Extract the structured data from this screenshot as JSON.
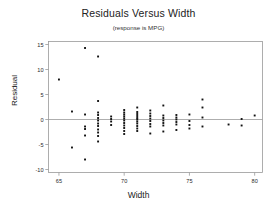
{
  "chart_data": {
    "type": "scatter",
    "title": "Residuals Versus Width",
    "subtitle": "(response is MPG)",
    "xlabel": "Width",
    "ylabel": "Residual",
    "xlim": [
      64.2,
      80.6
    ],
    "ylim": [
      -10.6,
      15.6
    ],
    "xticks": [
      65,
      70,
      75,
      80
    ],
    "xtick_labels": [
      "65",
      "70",
      "75",
      "80"
    ],
    "yticks": [
      15,
      10,
      5,
      0,
      -5,
      -10
    ],
    "ytick_labels": [
      "15",
      "10",
      "5",
      "0",
      "-5",
      "-10"
    ],
    "grid": false,
    "legend": null,
    "reference_line": {
      "orientation": "horizontal",
      "y": 0,
      "color": "#999999"
    },
    "marker": {
      "shape": "square",
      "size": 1.9,
      "color": "#111111"
    },
    "frame_color": "#9a9a9a",
    "points": [
      [
        65.0,
        8.0
      ],
      [
        66.0,
        1.6
      ],
      [
        66.0,
        -5.6
      ],
      [
        67.0,
        14.3
      ],
      [
        67.0,
        1.0
      ],
      [
        67.0,
        -1.4
      ],
      [
        67.0,
        -1.9
      ],
      [
        67.0,
        -3.2
      ],
      [
        67.0,
        -8.0
      ],
      [
        68.0,
        12.6
      ],
      [
        68.0,
        3.7
      ],
      [
        68.0,
        1.4
      ],
      [
        68.0,
        0.9
      ],
      [
        68.0,
        0.3
      ],
      [
        68.0,
        -0.2
      ],
      [
        68.0,
        -0.8
      ],
      [
        68.0,
        -1.3
      ],
      [
        68.0,
        -2.0
      ],
      [
        68.0,
        -2.6
      ],
      [
        68.0,
        -3.3
      ],
      [
        68.0,
        -4.4
      ],
      [
        69.0,
        0.6
      ],
      [
        69.0,
        0.1
      ],
      [
        69.0,
        -0.4
      ],
      [
        69.0,
        -1.1
      ],
      [
        70.0,
        1.9
      ],
      [
        70.0,
        1.4
      ],
      [
        70.0,
        1.0
      ],
      [
        70.0,
        0.6
      ],
      [
        70.0,
        0.2
      ],
      [
        70.0,
        -0.2
      ],
      [
        70.0,
        -0.7
      ],
      [
        70.0,
        -1.2
      ],
      [
        70.0,
        -1.7
      ],
      [
        70.0,
        -2.3
      ],
      [
        70.0,
        -2.9
      ],
      [
        71.0,
        2.4
      ],
      [
        71.0,
        1.5
      ],
      [
        71.0,
        1.1
      ],
      [
        71.0,
        0.7
      ],
      [
        71.0,
        0.3
      ],
      [
        71.0,
        0.0
      ],
      [
        71.0,
        -0.4
      ],
      [
        71.0,
        -0.8
      ],
      [
        71.0,
        -1.3
      ],
      [
        71.0,
        -1.8
      ],
      [
        71.0,
        -2.3
      ],
      [
        72.0,
        1.8
      ],
      [
        72.0,
        1.2
      ],
      [
        72.0,
        0.7
      ],
      [
        72.0,
        0.2
      ],
      [
        72.0,
        -0.3
      ],
      [
        72.0,
        -0.9
      ],
      [
        72.0,
        -1.4
      ],
      [
        72.0,
        -2.8
      ],
      [
        73.0,
        2.8
      ],
      [
        73.0,
        0.8
      ],
      [
        73.0,
        0.3
      ],
      [
        73.0,
        -0.2
      ],
      [
        73.0,
        -0.7
      ],
      [
        73.0,
        -1.2
      ],
      [
        73.0,
        -2.4
      ],
      [
        74.0,
        0.9
      ],
      [
        74.0,
        0.4
      ],
      [
        74.0,
        0.0
      ],
      [
        74.0,
        -0.5
      ],
      [
        74.0,
        -1.0
      ],
      [
        74.0,
        -2.1
      ],
      [
        75.0,
        1.0
      ],
      [
        75.0,
        -0.3
      ],
      [
        75.0,
        -1.1
      ],
      [
        75.0,
        -1.8
      ],
      [
        76.0,
        4.0
      ],
      [
        76.0,
        2.4
      ],
      [
        76.0,
        0.4
      ],
      [
        76.0,
        -1.4
      ],
      [
        78.0,
        -1.0
      ],
      [
        79.0,
        0.1
      ],
      [
        79.0,
        -1.2
      ],
      [
        80.0,
        0.8
      ]
    ]
  }
}
